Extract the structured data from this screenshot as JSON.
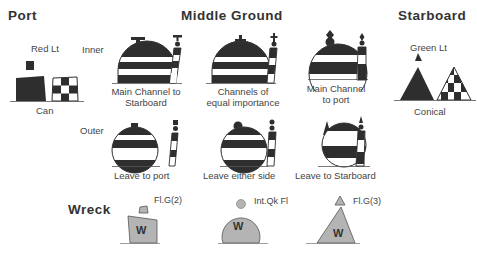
{
  "headings": {
    "port": "Port",
    "middle_ground": "Middle Ground",
    "starboard": "Starboard",
    "wreck": "Wreck"
  },
  "row_labels": {
    "inner": "Inner",
    "outer": "Outer"
  },
  "port": {
    "light": "Red Lt",
    "shape": "Can"
  },
  "starboard": {
    "light": "Green Lt",
    "shape": "Conical"
  },
  "middle_ground": {
    "inner": [
      {
        "line1": "Main Channel to",
        "line2": "Starboard",
        "topmark": "T-shape"
      },
      {
        "line1": "Channels of",
        "line2": "equal importance",
        "topmark": "cross"
      },
      {
        "line1": "Main Channel",
        "line2": "to port",
        "topmark": "diamond-over-sphere"
      }
    ],
    "outer": [
      {
        "label": "Leave to port",
        "topmark": "can"
      },
      {
        "label": "Leave either side",
        "topmark": "sphere"
      },
      {
        "label": "Leave to Starboard",
        "topmark": "cone"
      }
    ]
  },
  "wreck": {
    "items": [
      {
        "light": "Fl.G(2)",
        "mark": "W",
        "shape": "can"
      },
      {
        "light": "Int.Qk Fl",
        "mark": "W",
        "shape": "spherical"
      },
      {
        "light": "Fl.G(3)",
        "mark": "W",
        "shape": "conical"
      }
    ]
  },
  "colors": {
    "ink": "#2e2e2e",
    "wreck_fill": "#b4b4b4",
    "background": "#ffffff"
  }
}
